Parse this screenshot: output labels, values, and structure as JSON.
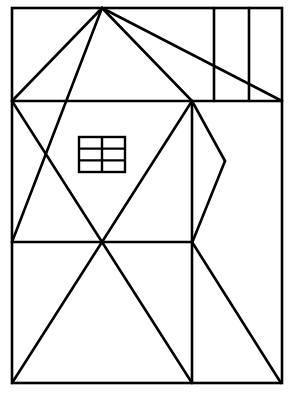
{
  "figure": {
    "stroke_color": "#000000",
    "background": "#ffffff",
    "frame": {
      "x1": 12,
      "y1": 8,
      "x2": 282,
      "y2": 383
    },
    "lines": [
      {
        "name": "roof-left",
        "x1": 12,
        "y1": 101,
        "x2": 102,
        "y2": 8
      },
      {
        "name": "roof-right",
        "x1": 102,
        "y1": 8,
        "x2": 192,
        "y2": 101
      },
      {
        "name": "long-diagonal-top-right",
        "x1": 102,
        "y1": 8,
        "x2": 282,
        "y2": 101
      },
      {
        "name": "apex-to-left-mid",
        "x1": 102,
        "y1": 8,
        "x2": 12,
        "y2": 242
      },
      {
        "name": "horizontal-upper",
        "x1": 12,
        "y1": 101,
        "x2": 282,
        "y2": 101
      },
      {
        "name": "vertical-top-1",
        "x1": 214,
        "y1": 8,
        "x2": 214,
        "y2": 101
      },
      {
        "name": "vertical-top-2",
        "x1": 249,
        "y1": 8,
        "x2": 249,
        "y2": 101
      },
      {
        "name": "left-mid-diagonal",
        "x1": 12,
        "y1": 101,
        "x2": 102,
        "y2": 242
      },
      {
        "name": "right-mid-diagonal",
        "x1": 192,
        "y1": 101,
        "x2": 102,
        "y2": 242
      },
      {
        "name": "vertical-middle",
        "x1": 192,
        "y1": 101,
        "x2": 192,
        "y2": 383
      },
      {
        "name": "chevron-upper",
        "x1": 192,
        "y1": 101,
        "x2": 225,
        "y2": 161
      },
      {
        "name": "chevron-lower",
        "x1": 225,
        "y1": 161,
        "x2": 192,
        "y2": 243
      },
      {
        "name": "horizontal-lower",
        "x1": 12,
        "y1": 242,
        "x2": 192,
        "y2": 242
      },
      {
        "name": "bottom-left-diagonal",
        "x1": 12,
        "y1": 383,
        "x2": 102,
        "y2": 242
      },
      {
        "name": "bottom-center-diagonal",
        "x1": 102,
        "y1": 242,
        "x2": 192,
        "y2": 383
      },
      {
        "name": "bottom-right-diagonal",
        "x1": 192,
        "y1": 242,
        "x2": 281,
        "y2": 383
      }
    ],
    "window": {
      "x": 79,
      "y": 137,
      "w": 46,
      "h": 35,
      "cols": 2,
      "rows": 3
    }
  }
}
